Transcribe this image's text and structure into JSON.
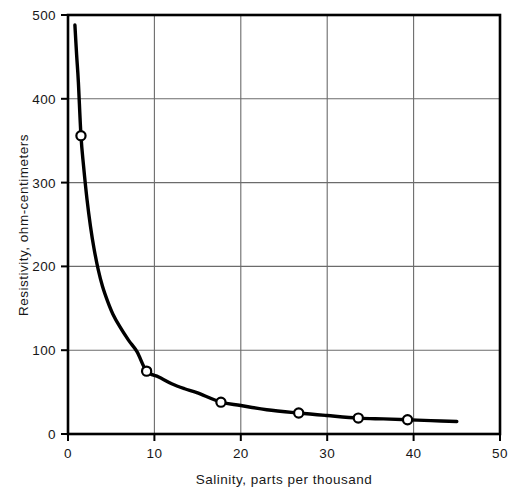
{
  "chart_data": {
    "type": "line",
    "title": "",
    "xlabel": "Salinity, parts per thousand",
    "ylabel": "Resistivity, ohm-centimeters",
    "xlim": [
      0,
      50
    ],
    "ylim": [
      0,
      500
    ],
    "xticks": [
      0,
      10,
      20,
      30,
      40,
      50
    ],
    "yticks": [
      0,
      100,
      200,
      300,
      400,
      500
    ],
    "xtick_labels": [
      "0",
      "10",
      "20",
      "30",
      "40",
      "50"
    ],
    "ytick_labels": [
      "0",
      "100",
      "200",
      "300",
      "400",
      "500"
    ],
    "grid": true,
    "legend": null,
    "series": [
      {
        "name": "Resistivity vs salinity",
        "marker": "open-circle",
        "line_color": "#000000",
        "x": [
          1.5,
          9.1,
          17.7,
          26.7,
          33.6,
          39.3
        ],
        "y": [
          356,
          75,
          38,
          25,
          19,
          17
        ]
      }
    ],
    "curve": {
      "name": "fitted-curve",
      "x": [
        0.8,
        1.0,
        1.2,
        1.5,
        1.8,
        2.2,
        2.6,
        3.0,
        3.5,
        4.0,
        4.6,
        5.2,
        6.0,
        7.0,
        8.0,
        9.1,
        10.5,
        12.0,
        13.5,
        15.0,
        17.7,
        20.0,
        23.0,
        26.7,
        30.0,
        33.6,
        36.5,
        39.3,
        42.0,
        45.0
      ],
      "y": [
        488,
        452,
        420,
        356,
        320,
        280,
        248,
        222,
        196,
        176,
        158,
        143,
        128,
        112,
        98,
        75,
        68,
        60,
        54,
        49,
        38,
        34,
        29,
        25,
        22,
        19,
        18,
        17,
        16,
        15
      ]
    }
  },
  "figure": {
    "caption_ghost": "",
    "axis_color": "#000000",
    "grid_color": "#6b6b6b",
    "marker_fill": "#ffffff"
  }
}
